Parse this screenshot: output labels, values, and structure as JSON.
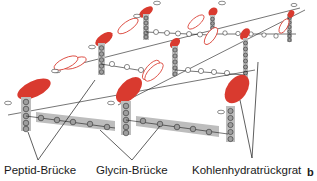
{
  "figure": {
    "panel_letter": "b",
    "colors": {
      "nam_fill": "#d93a2f",
      "nag_stroke": "#d93a2f",
      "peptide_bar": "#bdbdbd",
      "circle_fill": "#9e9e9e",
      "line": "#1a1a1a"
    },
    "labels": [
      {
        "id": "peptide",
        "text": "Peptid-Brücke"
      },
      {
        "id": "glycine",
        "text": "Glycin-Brücke"
      },
      {
        "id": "backbone",
        "text": "Kohlenhydratrückgrat"
      }
    ]
  }
}
